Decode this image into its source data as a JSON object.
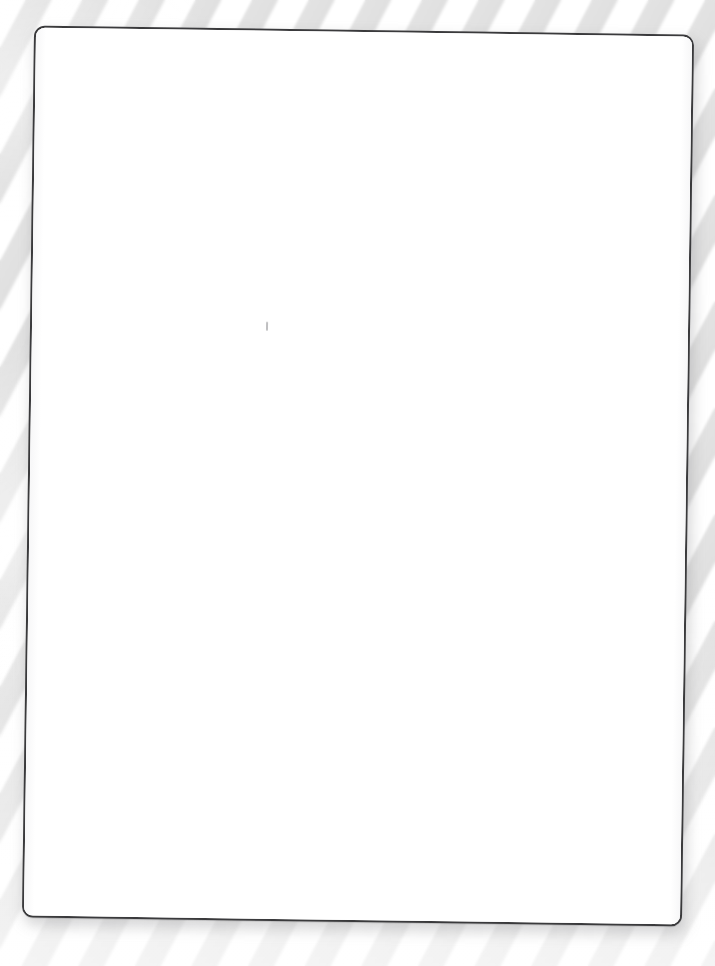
{
  "scene": {
    "description": "Blank white card on striped surface",
    "width": 715,
    "height": 966,
    "background_color": "#ffffff"
  },
  "surface": {
    "name": "striped-background",
    "stripe_light_color": "#ffffff",
    "stripe_grey_color": "#e0e0e0",
    "stripe_angle_deg": 118,
    "stripe_period_px": 50
  },
  "card": {
    "name": "blank-card",
    "fill_color": "#ffffff",
    "border_color": "#3a3a3c",
    "border_width_px": 2.5,
    "corner_radius_px": 11,
    "rotation_deg": 0.78,
    "left_px": 28,
    "top_px": 30,
    "width_px": 660,
    "height_px": 892,
    "shadow_color": "rgba(120,120,124,0.30)",
    "content_text": "",
    "artifact": {
      "name": "faint-mark",
      "x_px": 264,
      "y_px": 323,
      "color": "rgba(128,128,132,0.50)"
    }
  }
}
